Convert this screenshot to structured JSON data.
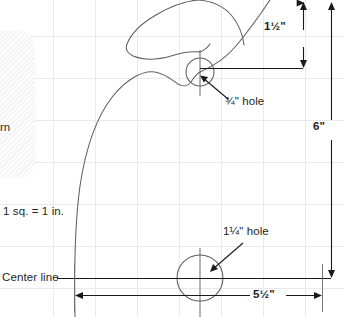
{
  "drawing": {
    "title_fragment": "rn",
    "scale_note": "1 sq. = 1 in.",
    "center_line_label": "Center line",
    "dimensions": {
      "height_overall": "6\"",
      "top_offset": "1½\"",
      "width_overall": "5½\""
    },
    "callouts": {
      "small_hole": "¾\" hole",
      "large_hole": "1¼\" hole"
    },
    "grid": {
      "square_inch": 1,
      "spacing_px": 42,
      "color": "#e9e9ee"
    },
    "colors": {
      "background": "#ffffff",
      "outline": "#5a5a60",
      "dimension": "#1a1a1a",
      "grid": "#e9e9ee",
      "text": "#231f20",
      "swatch": "#f3f3f5"
    },
    "geometry": {
      "small_hole_center": [
        200,
        72
      ],
      "small_hole_radius": 14,
      "large_hole_center": [
        200,
        278
      ],
      "large_hole_radius": 23,
      "baseline_y": 278,
      "left_edge_x": 74,
      "right_edge_x": 322
    }
  }
}
